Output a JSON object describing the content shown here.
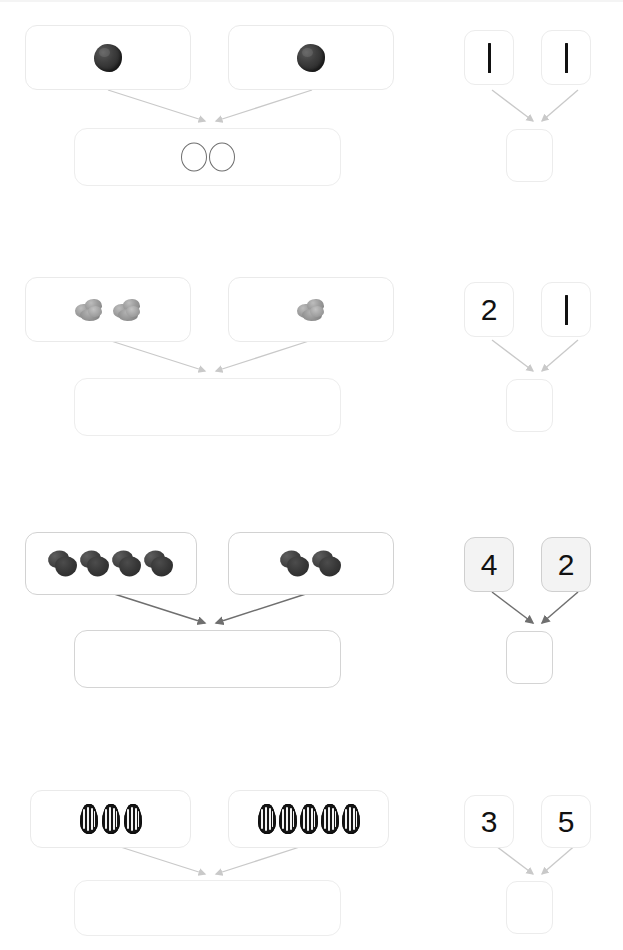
{
  "worksheet": {
    "title": "Addition number bonds with picture groups",
    "type": "math-worksheet",
    "operation": "addition",
    "problem_count": 4,
    "colors": {
      "page_background": "#ffffff",
      "box_border_light": "#eaeaea",
      "box_border_dark": "#d2d2d2",
      "shaded_box_fill": "#f3f3f3",
      "arrow_light": "#c9c9c9",
      "arrow_dark": "#6f6f6f",
      "digit_color": "#111111"
    }
  },
  "problems": [
    {
      "index": 1,
      "addend_left": {
        "count": 2,
        "label": "2",
        "item_icon": "dark-seed-icon",
        "item_name": "dark seed"
      },
      "addend_right": {
        "count": 1,
        "label": "1",
        "item_icon": "dark-seed-icon",
        "item_name": "dark seed"
      },
      "groups": [
        {
          "group_name": "picture-group-left",
          "item_icon": "dark-seed-icon",
          "item_count": 1
        },
        {
          "group_name": "picture-group-right",
          "item_icon": "dark-seed-icon",
          "item_count": 1
        }
      ],
      "sum_box": {
        "filled": true,
        "drawn_marks": 2,
        "mark_icon": "circle-outline-icon",
        "answer_text": ""
      },
      "number_left": {
        "value": "1",
        "render": "vertical-stroke",
        "shaded": false
      },
      "number_right": {
        "value": "1",
        "render": "vertical-stroke",
        "shaded": false
      },
      "number_sum": {
        "value": "",
        "shaded": false
      },
      "arrow_style": "light"
    },
    {
      "index": 2,
      "addend_left": {
        "count": 2,
        "label": "2",
        "item_icon": "gray-walnut-cluster-icon",
        "item_name": "gray nut cluster"
      },
      "addend_right": {
        "count": 1,
        "label": "1",
        "item_icon": "gray-walnut-cluster-icon",
        "item_name": "gray nut cluster"
      },
      "groups": [
        {
          "group_name": "picture-group-left",
          "item_icon": "gray-walnut-cluster-icon",
          "item_count": 2
        },
        {
          "group_name": "picture-group-right",
          "item_icon": "gray-walnut-cluster-icon",
          "item_count": 1
        }
      ],
      "sum_box": {
        "filled": false,
        "drawn_marks": 0,
        "mark_icon": "",
        "answer_text": ""
      },
      "number_left": {
        "value": "2",
        "render": "digit",
        "shaded": false
      },
      "number_right": {
        "value": "1",
        "render": "vertical-stroke",
        "shaded": false
      },
      "number_sum": {
        "value": "",
        "shaded": false
      },
      "arrow_style": "light"
    },
    {
      "index": 3,
      "addend_left": {
        "count": 4,
        "label": "4",
        "item_icon": "dark-acorn-icon",
        "item_name": "dark acorn"
      },
      "addend_right": {
        "count": 2,
        "label": "2",
        "item_icon": "dark-acorn-icon",
        "item_name": "dark acorn"
      },
      "groups": [
        {
          "group_name": "picture-group-left",
          "item_icon": "dark-acorn-icon",
          "item_count": 4
        },
        {
          "group_name": "picture-group-right",
          "item_icon": "dark-acorn-icon",
          "item_count": 2
        }
      ],
      "sum_box": {
        "filled": false,
        "drawn_marks": 0,
        "mark_icon": "",
        "answer_text": ""
      },
      "number_left": {
        "value": "4",
        "render": "digit",
        "shaded": true
      },
      "number_right": {
        "value": "2",
        "render": "digit",
        "shaded": true
      },
      "number_sum": {
        "value": "",
        "shaded": false
      },
      "arrow_style": "dark"
    },
    {
      "index": 4,
      "addend_left": {
        "count": 3,
        "label": "3",
        "item_icon": "sunflower-seed-icon",
        "item_name": "sunflower seed"
      },
      "addend_right": {
        "count": 5,
        "label": "5",
        "item_icon": "sunflower-seed-icon",
        "item_name": "sunflower seed"
      },
      "groups": [
        {
          "group_name": "picture-group-left",
          "item_icon": "sunflower-seed-icon",
          "item_count": 3
        },
        {
          "group_name": "picture-group-right",
          "item_icon": "sunflower-seed-icon",
          "item_count": 5
        }
      ],
      "sum_box": {
        "filled": false,
        "drawn_marks": 0,
        "mark_icon": "",
        "answer_text": ""
      },
      "number_left": {
        "value": "3",
        "render": "digit",
        "shaded": false
      },
      "number_right": {
        "value": "5",
        "render": "digit",
        "shaded": false
      },
      "number_sum": {
        "value": "",
        "shaded": false
      },
      "arrow_style": "light"
    }
  ]
}
